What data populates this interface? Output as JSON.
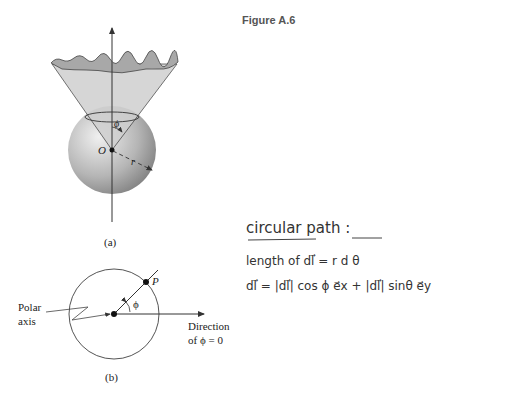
{
  "figure": {
    "title": "Figure A.6"
  },
  "diagram_a": {
    "caption": "(a)",
    "origin_label": "O",
    "angle_label": "ϕ",
    "radius_label": "r"
  },
  "diagram_b": {
    "caption": "(b)",
    "point_label": "P",
    "angle_label": "ϕ",
    "polar_axis_label_line1": "Polar",
    "polar_axis_label_line2": "axis",
    "direction_label_line1": "Direction",
    "direction_label_line2": "of ϕ = 0"
  },
  "handwritten_notes": {
    "heading": "circular path :",
    "line1": "length of dl⃗ = r d θ",
    "line2": "dl⃗ = |dl⃗| cos ϕ e⃗x + |dl⃗| sinθ e⃗y"
  },
  "colors": {
    "cone_fill": "#c8c8c8",
    "cone_cap": "#a9a9a9",
    "sphere_light": "#e6e6e6",
    "sphere_dark": "#8a8a8a",
    "line": "#333333"
  }
}
